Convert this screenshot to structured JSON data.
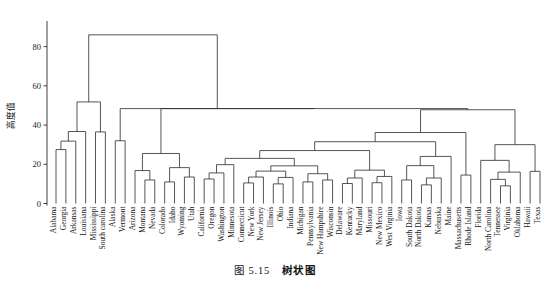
{
  "figure": {
    "caption_number": "图 5.15",
    "caption_title": "树状图",
    "y_axis_label": "高度值",
    "axis_color": "#2b2b2b",
    "line_color": "#2b2b2b"
  },
  "chart_data": {
    "type": "dendrogram",
    "title": "树状图",
    "xlabel": "",
    "ylabel": "高度值",
    "ylim": [
      0,
      90
    ],
    "yticks": [
      0,
      20,
      40,
      60,
      80
    ],
    "ytick_labels": [
      "0",
      "20",
      "40",
      "60",
      "80"
    ],
    "grid": false,
    "legend": "none",
    "orientation": "top",
    "leaves": [
      "Alabama",
      "Georgia",
      "Arkansas",
      "Louisiana",
      "Mississippi",
      "South carolina",
      "Alaska",
      "Vermont",
      "Arizona",
      "Montana",
      "Nevada",
      "Colorado",
      "Idaho",
      "Wyoming",
      "Utah",
      "California",
      "Oregon",
      "Washington",
      "Minnesota",
      "Connecticut",
      "New York",
      "New Jersey",
      "Illinois",
      "Ohio",
      "Indiana",
      "Michigan",
      "Pennsylvania",
      "New Hampshire",
      "Wisconsin",
      "Delaware",
      "Kentucky",
      "Maryland",
      "Missouri",
      "New Mexico",
      "West Virginia",
      "Iowa",
      "South Dakota",
      "North Dakota",
      "Kansas",
      "Nebraska",
      "Maine",
      "Massachusetts",
      "Rhode Island",
      "Florida",
      "North Carolina",
      "Tennessee",
      "Virginia",
      "Oklahoma",
      "Hawaii",
      "Texas"
    ],
    "merges": [
      {
        "id": 50,
        "left": "Alabama",
        "right": "Georgia",
        "height": 27.5
      },
      {
        "id": 51,
        "left": 50,
        "right": "Arkansas",
        "height": 31.8
      },
      {
        "id": 52,
        "left": "Louisiana",
        "right": 51,
        "height": 36.7
      },
      {
        "id": 53,
        "left": "Mississippi",
        "right": "South carolina",
        "height": 36.5
      },
      {
        "id": 54,
        "left": 52,
        "right": 53,
        "height": 51.8
      },
      {
        "id": 55,
        "left": "Alaska",
        "right": "Vermont",
        "height": 32.0
      },
      {
        "id": 56,
        "left": "Montana",
        "right": "Nevada",
        "height": 12.0
      },
      {
        "id": 57,
        "left": "Arizona",
        "right": 56,
        "height": 16.8
      },
      {
        "id": 58,
        "left": "Colorado",
        "right": "Idaho",
        "height": 11.0
      },
      {
        "id": 59,
        "left": "Wyoming",
        "right": "Utah",
        "height": 13.5
      },
      {
        "id": 60,
        "left": 58,
        "right": 59,
        "height": 18.3
      },
      {
        "id": 61,
        "left": 57,
        "right": 60,
        "height": 25.5
      },
      {
        "id": 62,
        "left": "California",
        "right": "Oregon",
        "height": 12.5
      },
      {
        "id": 63,
        "left": 62,
        "right": "Washington",
        "height": 15.6
      },
      {
        "id": 64,
        "left": 63,
        "right": "Minnesota",
        "height": 19.8
      },
      {
        "id": 65,
        "left": "Connecticut",
        "right": "New York",
        "height": 10.5
      },
      {
        "id": 66,
        "left": 65,
        "right": "New Jersey",
        "height": 13.5
      },
      {
        "id": 67,
        "left": "Illinois",
        "right": "Ohio",
        "height": 10.0
      },
      {
        "id": 68,
        "left": 67,
        "right": "Indiana",
        "height": 13.3
      },
      {
        "id": 69,
        "left": 66,
        "right": 68,
        "height": 16.5
      },
      {
        "id": 70,
        "left": "Michigan",
        "right": "Pennsylvania",
        "height": 11.0
      },
      {
        "id": 71,
        "left": "New Hampshire",
        "right": "Wisconsin",
        "height": 12.0
      },
      {
        "id": 72,
        "left": 70,
        "right": 71,
        "height": 15.2
      },
      {
        "id": 73,
        "left": 69,
        "right": 72,
        "height": 19.2
      },
      {
        "id": 74,
        "left": 64,
        "right": 73,
        "height": 23.0
      },
      {
        "id": 75,
        "left": "Delaware",
        "right": "Kentucky",
        "height": 10.2
      },
      {
        "id": 76,
        "left": 75,
        "right": "Maryland",
        "height": 13.0
      },
      {
        "id": 77,
        "left": "Missouri",
        "right": "New Mexico",
        "height": 10.6
      },
      {
        "id": 78,
        "left": 77,
        "right": "West Virginia",
        "height": 13.8
      },
      {
        "id": 79,
        "left": 76,
        "right": 78,
        "height": 17.0
      },
      {
        "id": 80,
        "left": 74,
        "right": 79,
        "height": 27.0
      },
      {
        "id": 81,
        "left": "Iowa",
        "right": "South Dakota",
        "height": 12.0
      },
      {
        "id": 82,
        "left": "North Dakota",
        "right": "Kansas",
        "height": 9.5
      },
      {
        "id": 83,
        "left": 82,
        "right": "Nebraska",
        "height": 13.0
      },
      {
        "id": 84,
        "left": 81,
        "right": 83,
        "height": 19.3
      },
      {
        "id": 85,
        "left": 84,
        "right": "Maine",
        "height": 24.0
      },
      {
        "id": 86,
        "left": 80,
        "right": 85,
        "height": 31.5
      },
      {
        "id": 87,
        "left": "Massachusetts",
        "right": "Rhode Island",
        "height": 14.5
      },
      {
        "id": 88,
        "left": 86,
        "right": 87,
        "height": 36.2
      },
      {
        "id": 89,
        "left": "Tennessee",
        "right": "Virginia",
        "height": 9.0
      },
      {
        "id": 90,
        "left": "North Carolina",
        "right": 89,
        "height": 12.3
      },
      {
        "id": 91,
        "left": 90,
        "right": "Oklahoma",
        "height": 16.0
      },
      {
        "id": 92,
        "left": "Florida",
        "right": 91,
        "height": 22.0
      },
      {
        "id": 93,
        "left": "Hawaii",
        "right": "Texas",
        "height": 16.4
      },
      {
        "id": 94,
        "left": 92,
        "right": 93,
        "height": 30.0
      },
      {
        "id": 95,
        "left": 88,
        "right": 94,
        "height": 47.8
      },
      {
        "id": 96,
        "left": 61,
        "right": 95,
        "height": 48.4
      },
      {
        "id": 97,
        "left": 55,
        "right": 96,
        "height": 48.4
      },
      {
        "id": 98,
        "left": 54,
        "right": 97,
        "height": 86.0
      }
    ]
  }
}
